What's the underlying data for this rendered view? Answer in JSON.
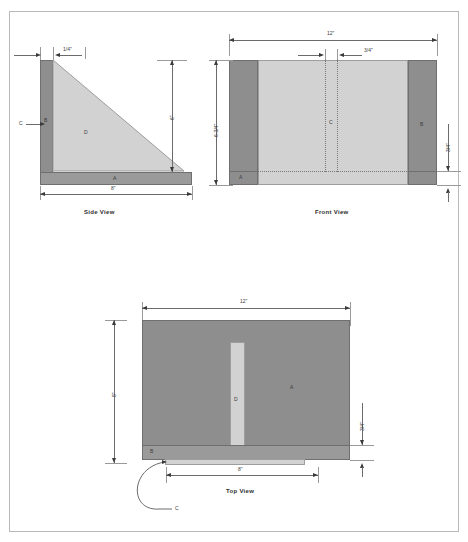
{
  "drawing": {
    "title": "Shop Fixture Orthographic Drawing",
    "page_background": "#ffffff",
    "border_color": "#b9b9b9",
    "colors": {
      "dark_gray": "#8e8e8e",
      "mid_gray": "#9a9a9a",
      "light_gray": "#d2d2d2",
      "line": "#6b6b6b",
      "text": "#3b3b3b"
    }
  },
  "views": [
    {
      "id": "side-view",
      "title": "Side View",
      "part_labels": [
        "C",
        "B",
        "D",
        "A"
      ],
      "dimensions": [
        {
          "name": "thickness-top",
          "value": "1/4\"",
          "orientation": "horizontal"
        },
        {
          "name": "height-right",
          "value": "6\"",
          "orientation": "vertical"
        },
        {
          "name": "width-bottom",
          "value": "8\"",
          "orientation": "horizontal"
        }
      ]
    },
    {
      "id": "front-view",
      "title": "Front View",
      "part_labels": [
        "C",
        "B",
        "A"
      ],
      "dimensions": [
        {
          "name": "width-top",
          "value": "12\"",
          "orientation": "horizontal"
        },
        {
          "name": "slot-width",
          "value": "3/4\"",
          "orientation": "horizontal"
        },
        {
          "name": "height-left",
          "value": "6-3/4\"",
          "orientation": "vertical"
        },
        {
          "name": "base-thickness-right",
          "value": "3/4\"",
          "orientation": "vertical"
        }
      ]
    },
    {
      "id": "top-view",
      "title": "Top View",
      "part_labels": [
        "A",
        "D",
        "B",
        "C"
      ],
      "dimensions": [
        {
          "name": "width-top",
          "value": "12\"",
          "orientation": "horizontal"
        },
        {
          "name": "depth-left",
          "value": "8\"",
          "orientation": "vertical"
        },
        {
          "name": "lip-right",
          "value": "3/4\"",
          "orientation": "vertical"
        },
        {
          "name": "width-bottom",
          "value": "8\"",
          "orientation": "horizontal"
        }
      ]
    }
  ],
  "labels": {
    "side": {
      "c": "C",
      "b": "B",
      "d": "D",
      "a": "A",
      "d_quarter": "1/4\"",
      "d_six": "6\"",
      "d_eight": "8\"",
      "title": "Side View"
    },
    "front": {
      "c": "C",
      "b": "B",
      "a": "A",
      "d_twelve": "12\"",
      "d_threequarter": "3/4\"",
      "d_sixthreequarter": "6-3/4\"",
      "d_base": "3/4\"",
      "title": "Front View"
    },
    "top": {
      "a": "A",
      "d": "D",
      "b": "B",
      "c": "C",
      "d_twelve": "12\"",
      "d_eight_left": "8\"",
      "d_threequarter": "3/4\"",
      "d_eight_bottom": "8\"",
      "title": "Top View"
    }
  }
}
